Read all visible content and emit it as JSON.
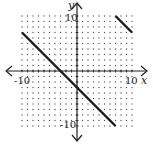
{
  "chart_data": {
    "type": "line",
    "title": "",
    "xlabel": "x",
    "ylabel": "y",
    "xlim": [
      -10,
      10
    ],
    "ylim": [
      -10,
      10
    ],
    "grid": "dotted",
    "tick_labels": {
      "x_min": "-10",
      "x_max": "10",
      "y_min": "-10",
      "y_max": "10"
    },
    "series": [
      {
        "name": "segment-1",
        "equation": "y = -x - 3",
        "points": [
          [
            -10,
            7
          ],
          [
            7,
            -10
          ]
        ]
      },
      {
        "name": "segment-2",
        "equation": "y = -x + 17",
        "points": [
          [
            7,
            10
          ],
          [
            10,
            7
          ]
        ]
      }
    ],
    "colors": {
      "line": "#1a1a1a",
      "axis": "#222222",
      "grid": "#555555"
    }
  }
}
